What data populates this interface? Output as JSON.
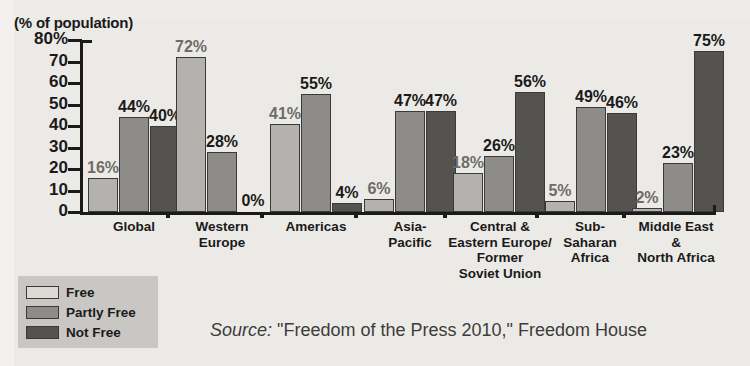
{
  "figure": {
    "axis_caption": "(% of population)",
    "title_sliver": "",
    "source_word": "Source:",
    "source_text": " \"Freedom of the Press 2010,\" Freedom House"
  },
  "legend": {
    "position": "bottom-left",
    "items": [
      {
        "label": "Free",
        "color": "#ddd9d4",
        "key": "free"
      },
      {
        "label": "Partly Free",
        "color": "#8e8c88",
        "key": "partly"
      },
      {
        "label": "Not Free",
        "color": "#55534f",
        "key": "notfree"
      }
    ]
  },
  "chart_data": {
    "type": "bar",
    "title": "",
    "xlabel": "",
    "ylabel": "(% of population)",
    "ylim": [
      0,
      80
    ],
    "yticks": [
      0,
      10,
      20,
      30,
      40,
      50,
      60,
      70,
      80
    ],
    "ytick_labels": [
      "0",
      "10",
      "20",
      "30",
      "40",
      "50",
      "60",
      "70",
      "80%"
    ],
    "grid": false,
    "legend_position": "bottom-left",
    "categories": [
      "Global",
      "Western Europe",
      "Americas",
      "Asia-Pacific",
      "Central & Eastern Europe/ Former Soviet Union",
      "Sub-Saharan Africa",
      "Middle East & North Africa"
    ],
    "category_lines": [
      [
        "Global"
      ],
      [
        "Western",
        "Europe"
      ],
      [
        "Americas"
      ],
      [
        "Asia-",
        "Pacific"
      ],
      [
        "Central &",
        "Eastern Europe/",
        "Former",
        "Soviet Union"
      ],
      [
        "Sub-",
        "Saharan",
        "Africa"
      ],
      [
        "Middle East",
        "&",
        "North Africa"
      ]
    ],
    "series": [
      {
        "name": "Free",
        "color": "#b4b2ae",
        "values": [
          16,
          72,
          41,
          6,
          18,
          5,
          2
        ],
        "labels": [
          "16%",
          "72%",
          "41%",
          "6%",
          "18%",
          "5%",
          "2%"
        ]
      },
      {
        "name": "Partly Free",
        "color": "#8e8c88",
        "values": [
          44,
          28,
          55,
          47,
          26,
          49,
          23
        ],
        "labels": [
          "44%",
          "28%",
          "55%",
          "47%",
          "26%",
          "49%",
          "23%"
        ]
      },
      {
        "name": "Not Free",
        "color": "#55534f",
        "values": [
          40,
          0,
          4,
          47,
          56,
          46,
          75
        ],
        "labels": [
          "40%",
          "0%",
          "4%",
          "47%",
          "56%",
          "46%",
          "75%"
        ]
      }
    ]
  }
}
